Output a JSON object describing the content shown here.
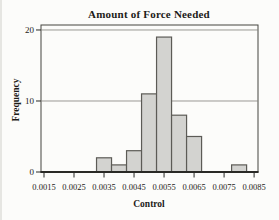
{
  "chart_data": {
    "type": "bar",
    "subtype": "histogram",
    "title": "Amount of Force Needed",
    "xlabel": "Control",
    "ylabel": "Frequency",
    "bin_width": 0.0005,
    "bins": [
      {
        "center": 0.0035,
        "count": 2
      },
      {
        "center": 0.004,
        "count": 1
      },
      {
        "center": 0.0045,
        "count": 3
      },
      {
        "center": 0.005,
        "count": 11
      },
      {
        "center": 0.0055,
        "count": 19
      },
      {
        "center": 0.006,
        "count": 8
      },
      {
        "center": 0.0065,
        "count": 5
      },
      {
        "center": 0.007,
        "count": 0
      },
      {
        "center": 0.0075,
        "count": 0
      },
      {
        "center": 0.008,
        "count": 1
      }
    ],
    "x_ticks": [
      0.0015,
      0.0025,
      0.0035,
      0.0045,
      0.0055,
      0.0065,
      0.0075,
      0.0085
    ],
    "x_tick_labels": [
      "0.0015",
      "0.0025",
      "0.0035",
      "0.0045",
      "0.0055",
      "0.0065",
      "0.0075",
      "0.0085"
    ],
    "y_ticks": [
      0,
      10,
      20
    ],
    "y_tick_labels": [
      "0",
      "10",
      "20"
    ],
    "xlim": [
      0.0014,
      0.00863
    ],
    "ylim": [
      0,
      20.7
    ],
    "gridlines_at": [
      10,
      20
    ],
    "legend": "none",
    "colors": {
      "bar_fill": "#d3d3d0",
      "bar_stroke": "#5c5b56",
      "grid": "#9a9994",
      "box_border": "#45443f",
      "axis": "#2a2a26",
      "text": "#1c1b18",
      "background": "#fcfcfa"
    }
  }
}
